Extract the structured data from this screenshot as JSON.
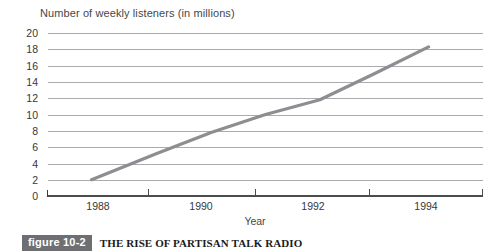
{
  "chart_data": {
    "type": "line",
    "title": "Number of weekly listeners (in millions)",
    "xlabel": "Year",
    "ylabel": "Number of weekly listeners (in millions)",
    "xlim": [
      1987,
      1995
    ],
    "ylim": [
      0,
      20
    ],
    "grid": true,
    "legend": "none",
    "y_ticks": [
      20,
      18,
      16,
      14,
      12,
      10,
      8,
      6,
      4,
      2,
      0
    ],
    "x_ticks": [
      1988,
      1990,
      1992,
      1994
    ],
    "series": [
      {
        "name": "Weekly listeners",
        "color": "#8d8e91",
        "x": [
          1987.8,
          1989,
          1990,
          1991,
          1992,
          1993,
          1994
        ],
        "values": [
          2.0,
          5.2,
          7.8,
          10.0,
          11.8,
          15.0,
          18.3
        ]
      }
    ]
  },
  "chart": {
    "title": "Number of weekly listeners (in millions)",
    "axis_x_title": "Year",
    "y_labels": [
      "20",
      "18",
      "16",
      "14",
      "12",
      "10",
      "8",
      "6",
      "4",
      "2",
      "0"
    ],
    "x_labels": [
      "1988",
      "1990",
      "1992",
      "1994"
    ],
    "line_color": "#8d8e91",
    "grid_color": "#a9abae",
    "axis_color": "#4a4c4f"
  },
  "caption": {
    "badge": "figure 10-2",
    "text": "THE RISE OF PARTISAN TALK RADIO",
    "badge_color": "#6e6f72"
  }
}
